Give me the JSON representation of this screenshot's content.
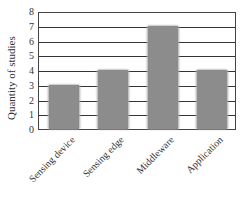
{
  "chart_data": {
    "type": "bar",
    "title": "",
    "xlabel": "",
    "ylabel": "Quantity of studies",
    "categories": [
      "Sensing device",
      "Sensing edge",
      "Middleware",
      "Application"
    ],
    "values": [
      3,
      4,
      7,
      4
    ],
    "ylim": [
      0,
      8
    ],
    "yticks": [
      "0",
      "1",
      "2",
      "3",
      "4",
      "5",
      "6",
      "7",
      "8"
    ],
    "grid": true,
    "legend": null,
    "bar_color": "#8c8c8c"
  }
}
